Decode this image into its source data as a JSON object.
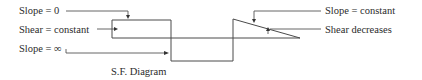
{
  "diagram": {
    "title": "S.F. Diagram",
    "labels": {
      "slope_zero": "Slope = 0",
      "shear_constant": "Shear = constant",
      "slope_infinity": "Slope = ∞",
      "slope_constant": "Slope = constant",
      "shear_decreases": "Shear decreases"
    },
    "colors": {
      "line": "#4a4a4a",
      "text": "#2b2b2b",
      "background": "#ffffff"
    }
  }
}
